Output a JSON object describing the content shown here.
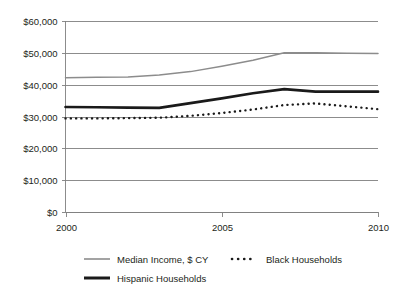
{
  "chart_data": {
    "type": "line",
    "title": "",
    "subtitle": "",
    "xlabel": "",
    "ylabel": "",
    "x": [
      2000,
      2001,
      2002,
      2003,
      2004,
      2005,
      2006,
      2007,
      2008,
      2009,
      2010
    ],
    "xlim": [
      2000,
      2010
    ],
    "ylim": [
      0,
      60000
    ],
    "grid": true,
    "legend_position": "bottom",
    "x_tick_values": [
      2000,
      2005,
      2010
    ],
    "x_tick_labels": [
      "2000",
      "2005",
      "2010"
    ],
    "y_tick_values": [
      0,
      10000,
      20000,
      30000,
      40000,
      50000,
      60000
    ],
    "y_tick_labels": [
      "$0",
      "$10,000",
      "$20,000",
      "$30,000",
      "$40,000",
      "$50,000",
      "$60,000"
    ],
    "series": [
      {
        "name": "Median Income, $ CY",
        "style": "thin-gray-line",
        "color": "#8c8c8c",
        "values": [
          42200,
          42300,
          42400,
          43000,
          44100,
          45800,
          47700,
          50000,
          50000,
          49900,
          49800
        ]
      },
      {
        "name": "Black Households",
        "style": "dotted-line",
        "color": "#1a1a1a",
        "values": [
          29400,
          29400,
          29500,
          29600,
          30200,
          31100,
          32200,
          33600,
          34100,
          33200,
          32300
        ]
      },
      {
        "name": "Hispanic Households",
        "style": "thick-black-line",
        "color": "#1a1a1a",
        "values": [
          33000,
          32900,
          32800,
          32700,
          34200,
          35700,
          37300,
          38600,
          37800,
          37800,
          37800
        ]
      }
    ]
  },
  "legend": {
    "items": [
      {
        "label": "Median Income, $ CY",
        "marker": "solid-thin-line-icon"
      },
      {
        "label": "Black Households",
        "marker": "dotted-line-icon"
      },
      {
        "label": "Hispanic Households",
        "marker": "solid-thick-line-icon"
      }
    ]
  }
}
